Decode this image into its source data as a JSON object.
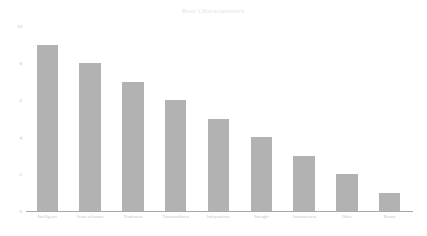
{
  "chart_data": {
    "type": "bar",
    "title": "Best Characteristics",
    "xlabel": "",
    "ylabel": "",
    "ylim": [
      0,
      10
    ],
    "grid": false,
    "legend": false,
    "yticks": [
      "10",
      "8",
      "6",
      "4",
      "2",
      "0"
    ],
    "ytick_values": [
      10,
      8,
      6,
      4,
      2,
      0
    ],
    "categories": [
      "Intelligence",
      "Sense of humor",
      "Tenderness",
      "Trustworthiness",
      "Independence",
      "Strength",
      "Attractiveness",
      "Other",
      "Beauty"
    ],
    "values": [
      9,
      8,
      7,
      6,
      5,
      4,
      3,
      2,
      1
    ],
    "bar_color": "#b2b2b2",
    "axis_color": "#a9a9a9",
    "title_color": "#e2e2e2",
    "tick_label_color": "#bdbdbd",
    "category_label_color": "#c2c2c2",
    "background_color": "#ffffff"
  }
}
